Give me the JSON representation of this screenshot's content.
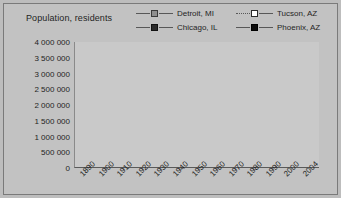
{
  "chart_data": {
    "type": "line",
    "title": "Population, residents",
    "xlabel": "",
    "ylabel": "Population, residents",
    "ylim": [
      0,
      4000000
    ],
    "ytick_step": 500000,
    "grid": true,
    "legend_position": "top",
    "categories": [
      "1890",
      "1900",
      "1910",
      "1920",
      "1930",
      "1940",
      "1950",
      "1960",
      "1970",
      "1980",
      "1990",
      "2000",
      "2004"
    ],
    "yticks": [
      "4 000 000",
      "3 500 000",
      "3 000 000",
      "2 500 000",
      "2 000 000",
      "1 500 000",
      "1 000 000",
      "500 000",
      "0"
    ],
    "ytick_values": [
      4000000,
      3500000,
      3000000,
      2500000,
      2000000,
      1500000,
      1000000,
      500000,
      0
    ],
    "series": [
      {
        "name": "Detroit, MI",
        "marker": "square-gray",
        "color": "#8f8f8f",
        "values": [
          205000,
          285000,
          465000,
          995000,
          1570000,
          1625000,
          1850000,
          1670000,
          1515000,
          1205000,
          1030000,
          950000,
          920000
        ]
      },
      {
        "name": "Chicago, IL",
        "marker": "square-dark",
        "color": "#2b2b2b",
        "values": [
          1100000,
          1700000,
          2185000,
          2700000,
          3375000,
          3395000,
          3620000,
          3550000,
          3370000,
          3005000,
          2785000,
          2900000,
          2870000
        ]
      },
      {
        "name": "Tucson, AZ",
        "marker": "square-white",
        "color": "#ffffff",
        "values": [
          5000,
          7500,
          13000,
          20000,
          32000,
          36000,
          45000,
          215000,
          265000,
          330000,
          405000,
          487000,
          512000
        ]
      },
      {
        "name": "Phoenix, AZ",
        "marker": "square-black",
        "color": "#0d0d0d",
        "values": [
          3000,
          5500,
          11000,
          29000,
          48000,
          65000,
          107000,
          440000,
          585000,
          790000,
          990000,
          1320000,
          1420000
        ]
      }
    ]
  }
}
